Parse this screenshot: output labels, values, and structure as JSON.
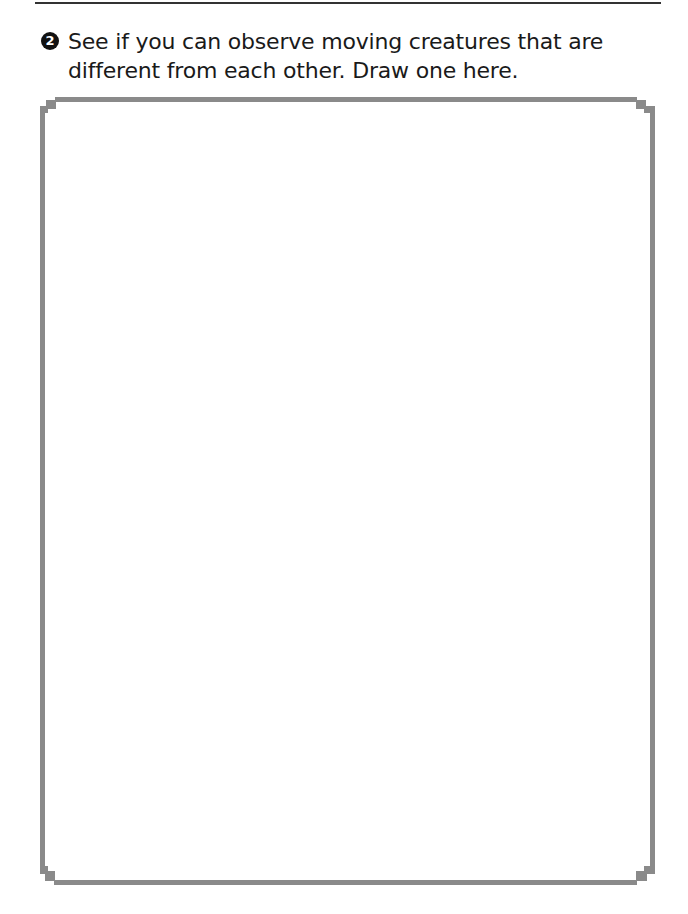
{
  "prompt": {
    "number": "2",
    "text": "See if you can observe moving creatures that are different from each other. Draw one here."
  },
  "drawing_area": {
    "border_color": "#8a8a8a"
  }
}
